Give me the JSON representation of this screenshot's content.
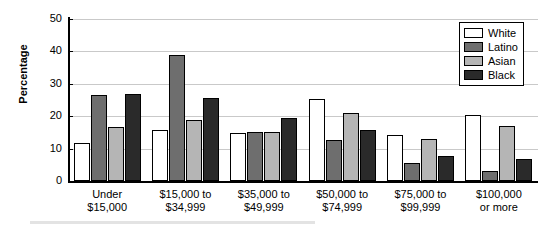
{
  "chart_data": {
    "type": "bar",
    "title": "",
    "xlabel": "",
    "ylabel": "Percentage",
    "ylim": [
      0,
      50
    ],
    "yticks": [
      0,
      10,
      20,
      30,
      40,
      50
    ],
    "grid": true,
    "legend_position": "top-right",
    "categories": [
      "Under\n$15,000",
      "$15,000 to\n$34,999",
      "$35,000 to\n$49,999",
      "$50,000 to\n$74,999",
      "$75,000 to\n$99,999",
      "$100,000\nor more"
    ],
    "category_lines": [
      [
        "Under",
        "$15,000"
      ],
      [
        "$15,000 to",
        "$34,999"
      ],
      [
        "$35,000 to",
        "$49,999"
      ],
      [
        "$50,000 to",
        "$74,999"
      ],
      [
        "$75,000 to",
        "$99,999"
      ],
      [
        "$100,000",
        "or more"
      ]
    ],
    "series": [
      {
        "name": "White",
        "color": "#ffffff",
        "values": [
          11.6,
          15.6,
          14.9,
          25.3,
          14.2,
          20.4
        ]
      },
      {
        "name": "Latino",
        "color": "#6e6e6e",
        "values": [
          26.4,
          39.0,
          15.2,
          12.7,
          5.5,
          3.2
        ]
      },
      {
        "name": "Asian",
        "color": "#b5b5b5",
        "values": [
          16.6,
          18.8,
          15.2,
          21.0,
          13.0,
          16.9
        ]
      },
      {
        "name": "Black",
        "color": "#2a2a2a",
        "values": [
          27.0,
          25.7,
          19.3,
          15.8,
          7.7,
          6.8
        ]
      }
    ]
  },
  "legend": {
    "items": [
      {
        "label": "White"
      },
      {
        "label": "Latino"
      },
      {
        "label": "Asian"
      },
      {
        "label": "Black"
      }
    ]
  }
}
